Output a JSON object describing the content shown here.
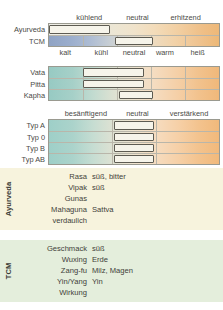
{
  "colors": {
    "ayurveda_panel_bg": "#f7f3dd",
    "tcm_panel_bg": "#e4eedc",
    "cool_end": "#8fa3c4",
    "warm_end": "#edb877",
    "teal_end": "#97cac3",
    "marker_fill": "#f6f4ea",
    "marker_border": "#5d5b52",
    "grid_line": "#b9b6aa"
  },
  "chart_data": {
    "type": "bar",
    "title": "",
    "blocks": [
      {
        "id": "thermal-scale",
        "top_axis_labels": [
          {
            "label": "kühlend",
            "pos_pct": 24
          },
          {
            "label": "neutral",
            "pos_pct": 52
          },
          {
            "label": "erhitzend",
            "pos_pct": 80
          }
        ],
        "bottom_axis_labels": [
          {
            "label": "kalt",
            "pos_pct": 10
          },
          {
            "label": "kühl",
            "pos_pct": 31
          },
          {
            "label": "neutral",
            "pos_pct": 50
          },
          {
            "label": "warm",
            "pos_pct": 68
          },
          {
            "label": "heiß",
            "pos_pct": 87
          }
        ],
        "dividers_pct": [
          20,
          40,
          60,
          80
        ],
        "rows": [
          {
            "label": "Ayurveda",
            "gradient": "ayur",
            "marker_start_pct": 0,
            "marker_end_pct": 36,
            "dividers": false
          },
          {
            "label": "TCM",
            "gradient": "tcm",
            "marker_start_pct": 39,
            "marker_end_pct": 61,
            "dividers": true
          }
        ]
      },
      {
        "id": "dosha-scale",
        "top_axis_labels": [],
        "bottom_axis_labels": [],
        "dividers_pct": [
          20,
          40,
          60,
          80
        ],
        "rows": [
          {
            "label": "Vata",
            "gradient": "dosha",
            "marker_start_pct": 20,
            "marker_end_pct": 56,
            "dividers": true
          },
          {
            "label": "Pitta",
            "gradient": "dosha",
            "marker_start_pct": 20,
            "marker_end_pct": 56,
            "dividers": true
          },
          {
            "label": "Kapha",
            "gradient": "dosha",
            "marker_start_pct": 41,
            "marker_end_pct": 61,
            "dividers": true
          }
        ]
      },
      {
        "id": "bloodtype-scale",
        "top_axis_labels": [
          {
            "label": "besänftigend",
            "pos_pct": 22
          },
          {
            "label": "neutral",
            "pos_pct": 52
          },
          {
            "label": "verstärkend",
            "pos_pct": 82
          }
        ],
        "bottom_axis_labels": [
          {
            "label": "günstig",
            "pos_pct": 22
          },
          {
            "label": "neutral",
            "pos_pct": 52
          },
          {
            "label": "meiden",
            "pos_pct": 82
          }
        ],
        "dividers_pct": [
          37,
          63
        ],
        "rows": [
          {
            "label": "Typ A",
            "gradient": "blood",
            "marker_start_pct": 38,
            "marker_end_pct": 62,
            "dividers": true
          },
          {
            "label": "Typ 0",
            "gradient": "blood",
            "marker_start_pct": 38,
            "marker_end_pct": 62,
            "dividers": true
          },
          {
            "label": "Typ B",
            "gradient": "blood",
            "marker_start_pct": 38,
            "marker_end_pct": 62,
            "dividers": true
          },
          {
            "label": "Typ AB",
            "gradient": "blood",
            "marker_start_pct": 38,
            "marker_end_pct": 62,
            "dividers": true
          }
        ]
      }
    ],
    "tables": [
      {
        "id": "ayurveda-table",
        "side_label": "Ayurveda",
        "rows": [
          {
            "key": "Rasa",
            "value": "süß, bitter"
          },
          {
            "key": "Vipak",
            "value": "süß"
          },
          {
            "key": "Gunas",
            "value": ""
          },
          {
            "key": "Mahaguna",
            "value": "Sattva"
          },
          {
            "key": "verdaulich",
            "value": ""
          }
        ]
      },
      {
        "id": "tcm-table",
        "side_label": "TCM",
        "rows": [
          {
            "key": "Geschmack",
            "value": "süß"
          },
          {
            "key": "Wuxing",
            "value": "Erde"
          },
          {
            "key": "Zang-fu",
            "value": "Milz, Magen"
          },
          {
            "key": "Yin/Yang",
            "value": "Yin"
          },
          {
            "key": "Wirkung",
            "value": ""
          }
        ]
      }
    ]
  }
}
